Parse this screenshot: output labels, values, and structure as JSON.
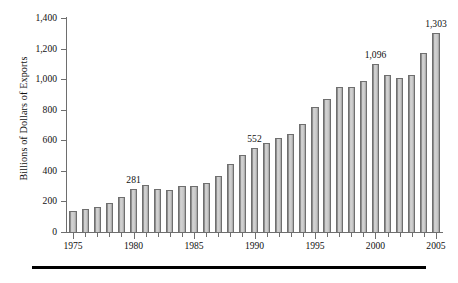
{
  "chart_data": {
    "type": "bar",
    "title": "",
    "xlabel": "",
    "ylabel": "Billions of Dollars of Exports",
    "ylim": [
      0,
      1400
    ],
    "ytick_labels": [
      "0",
      "200",
      "400",
      "600",
      "800",
      "1,000",
      "1,200",
      "1,400"
    ],
    "ytick_values": [
      0,
      200,
      400,
      600,
      800,
      1000,
      1200,
      1400
    ],
    "grid": false,
    "legend": null,
    "xtick_labels": [
      "1975",
      "1980",
      "1985",
      "1990",
      "1995",
      "2000",
      "2005"
    ],
    "xtick_values": [
      1975,
      1980,
      1985,
      1990,
      1995,
      2000,
      2005
    ],
    "categories": [
      "1975",
      "1976",
      "1977",
      "1978",
      "1979",
      "1980",
      "1981",
      "1982",
      "1983",
      "1984",
      "1985",
      "1986",
      "1987",
      "1988",
      "1989",
      "1990",
      "1991",
      "1992",
      "1993",
      "1994",
      "1995",
      "1996",
      "1997",
      "1998",
      "1999",
      "2000",
      "2001",
      "2002",
      "2003",
      "2004",
      "2005"
    ],
    "values": [
      140,
      150,
      162,
      188,
      230,
      281,
      305,
      283,
      277,
      304,
      300,
      320,
      365,
      445,
      505,
      552,
      580,
      617,
      640,
      705,
      815,
      870,
      950,
      950,
      990,
      1096,
      1025,
      1005,
      1025,
      1170,
      1303
    ],
    "annotations": [
      {
        "category": "1980",
        "text": "281"
      },
      {
        "category": "1990",
        "text": "552"
      },
      {
        "category": "2000",
        "text": "1,096"
      },
      {
        "category": "2005",
        "text": "1,303"
      }
    ],
    "bar_color": "#cccccc",
    "bar_edge_color": "#6f6f6f",
    "axis_color": "#6e6e6e"
  }
}
